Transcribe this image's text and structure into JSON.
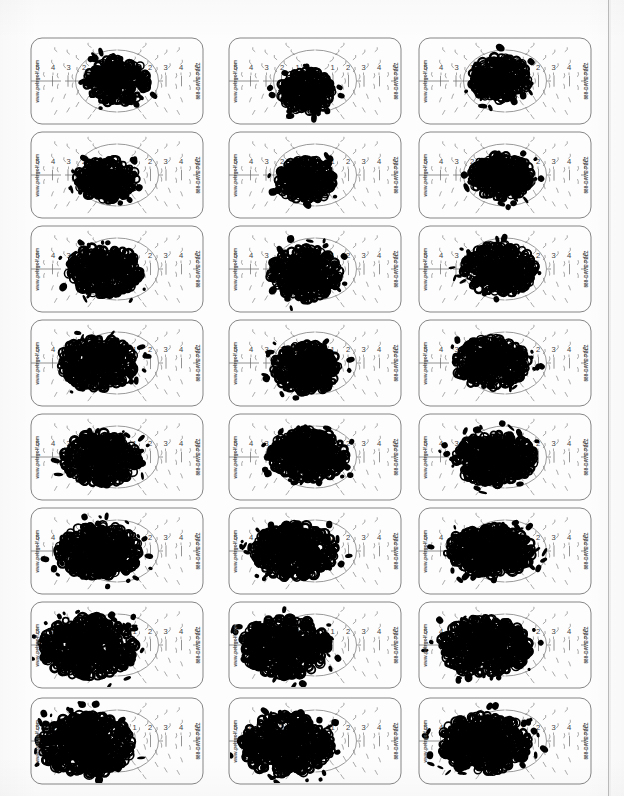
{
  "document": {
    "type": "scanned-page",
    "title": "Pelz Golf Putting Practice Target Cards",
    "background_color": "#fdfdfd",
    "ink_color": "#000000",
    "line_color": "#6f6f6f",
    "page_edge_color": "#b9b9b9",
    "width": 624,
    "height": 796,
    "grid": {
      "rows": 8,
      "columns": 3,
      "total_cards": 24
    }
  },
  "card_template": {
    "brand_url": "www.pelzgolf.com",
    "brand_phone": "888-DAVE-PELZ",
    "scale_labels_left": [
      "5",
      "4",
      "3",
      "2",
      "1"
    ],
    "scale_labels_right": [
      "1",
      "2",
      "3",
      "4",
      "5"
    ],
    "card_width": 174,
    "card_height": 88
  },
  "layout": {
    "column_x": [
      30,
      228,
      418
    ],
    "row_y": [
      37,
      131,
      225,
      319,
      413,
      507,
      601,
      697
    ]
  },
  "chart_data": {
    "type": "scatter",
    "xlabel": "Lateral dispersion (gradations 5-4-3-2-1 | 1-2-3-4-5)",
    "ylabel": "",
    "note": "Each card records cumulative ball-strike ink coverage; blot area grows and shifts left with each successive row.",
    "cards": [
      {
        "id": 1,
        "row": 1,
        "col": 1,
        "blot_cx": 0.5,
        "blot_cy": 0.5,
        "blot_rx": 0.18,
        "blot_ry": 0.26,
        "density": 0.34,
        "seed": 101
      },
      {
        "id": 2,
        "row": 1,
        "col": 2,
        "blot_cx": 0.45,
        "blot_cy": 0.62,
        "blot_rx": 0.15,
        "blot_ry": 0.24,
        "density": 0.3,
        "seed": 102
      },
      {
        "id": 3,
        "row": 1,
        "col": 3,
        "blot_cx": 0.47,
        "blot_cy": 0.47,
        "blot_rx": 0.17,
        "blot_ry": 0.25,
        "density": 0.33,
        "seed": 103
      },
      {
        "id": 4,
        "row": 2,
        "col": 1,
        "blot_cx": 0.44,
        "blot_cy": 0.55,
        "blot_rx": 0.17,
        "blot_ry": 0.23,
        "density": 0.34,
        "seed": 104
      },
      {
        "id": 5,
        "row": 2,
        "col": 2,
        "blot_cx": 0.45,
        "blot_cy": 0.56,
        "blot_rx": 0.16,
        "blot_ry": 0.24,
        "density": 0.33,
        "seed": 105
      },
      {
        "id": 6,
        "row": 2,
        "col": 3,
        "blot_cx": 0.48,
        "blot_cy": 0.52,
        "blot_rx": 0.18,
        "blot_ry": 0.25,
        "density": 0.36,
        "seed": 106
      },
      {
        "id": 7,
        "row": 3,
        "col": 1,
        "blot_cx": 0.43,
        "blot_cy": 0.52,
        "blot_rx": 0.21,
        "blot_ry": 0.28,
        "density": 0.4,
        "seed": 107
      },
      {
        "id": 8,
        "row": 3,
        "col": 2,
        "blot_cx": 0.44,
        "blot_cy": 0.55,
        "blot_rx": 0.2,
        "blot_ry": 0.3,
        "density": 0.42,
        "seed": 108
      },
      {
        "id": 9,
        "row": 3,
        "col": 3,
        "blot_cx": 0.47,
        "blot_cy": 0.5,
        "blot_rx": 0.21,
        "blot_ry": 0.28,
        "density": 0.42,
        "seed": 109
      },
      {
        "id": 10,
        "row": 4,
        "col": 1,
        "blot_cx": 0.39,
        "blot_cy": 0.5,
        "blot_rx": 0.22,
        "blot_ry": 0.29,
        "density": 0.46,
        "seed": 110
      },
      {
        "id": 11,
        "row": 4,
        "col": 2,
        "blot_cx": 0.45,
        "blot_cy": 0.56,
        "blot_rx": 0.19,
        "blot_ry": 0.28,
        "density": 0.42,
        "seed": 111
      },
      {
        "id": 12,
        "row": 4,
        "col": 3,
        "blot_cx": 0.42,
        "blot_cy": 0.5,
        "blot_rx": 0.21,
        "blot_ry": 0.28,
        "density": 0.44,
        "seed": 112
      },
      {
        "id": 13,
        "row": 5,
        "col": 1,
        "blot_cx": 0.41,
        "blot_cy": 0.52,
        "blot_rx": 0.22,
        "blot_ry": 0.29,
        "density": 0.47,
        "seed": 113
      },
      {
        "id": 14,
        "row": 5,
        "col": 2,
        "blot_cx": 0.46,
        "blot_cy": 0.48,
        "blot_rx": 0.22,
        "blot_ry": 0.28,
        "density": 0.47,
        "seed": 114
      },
      {
        "id": 15,
        "row": 5,
        "col": 3,
        "blot_cx": 0.44,
        "blot_cy": 0.52,
        "blot_rx": 0.23,
        "blot_ry": 0.29,
        "density": 0.49,
        "seed": 115
      },
      {
        "id": 16,
        "row": 6,
        "col": 1,
        "blot_cx": 0.4,
        "blot_cy": 0.5,
        "blot_rx": 0.24,
        "blot_ry": 0.3,
        "density": 0.52,
        "seed": 116
      },
      {
        "id": 17,
        "row": 6,
        "col": 2,
        "blot_cx": 0.38,
        "blot_cy": 0.5,
        "blot_rx": 0.24,
        "blot_ry": 0.3,
        "density": 0.53,
        "seed": 117
      },
      {
        "id": 18,
        "row": 6,
        "col": 3,
        "blot_cx": 0.41,
        "blot_cy": 0.5,
        "blot_rx": 0.25,
        "blot_ry": 0.28,
        "density": 0.52,
        "seed": 118
      },
      {
        "id": 19,
        "row": 7,
        "col": 1,
        "blot_cx": 0.33,
        "blot_cy": 0.52,
        "blot_rx": 0.27,
        "blot_ry": 0.34,
        "density": 0.6,
        "seed": 119
      },
      {
        "id": 20,
        "row": 7,
        "col": 2,
        "blot_cx": 0.33,
        "blot_cy": 0.52,
        "blot_rx": 0.25,
        "blot_ry": 0.33,
        "density": 0.58,
        "seed": 120
      },
      {
        "id": 21,
        "row": 7,
        "col": 3,
        "blot_cx": 0.38,
        "blot_cy": 0.52,
        "blot_rx": 0.26,
        "blot_ry": 0.32,
        "density": 0.58,
        "seed": 121
      },
      {
        "id": 22,
        "row": 8,
        "col": 1,
        "blot_cx": 0.32,
        "blot_cy": 0.54,
        "blot_rx": 0.27,
        "blot_ry": 0.34,
        "density": 0.62,
        "seed": 122
      },
      {
        "id": 23,
        "row": 8,
        "col": 2,
        "blot_cx": 0.34,
        "blot_cy": 0.54,
        "blot_rx": 0.26,
        "blot_ry": 0.34,
        "density": 0.61,
        "seed": 123
      },
      {
        "id": 24,
        "row": 8,
        "col": 3,
        "blot_cx": 0.38,
        "blot_cy": 0.52,
        "blot_rx": 0.26,
        "blot_ry": 0.32,
        "density": 0.6,
        "seed": 124
      }
    ]
  }
}
